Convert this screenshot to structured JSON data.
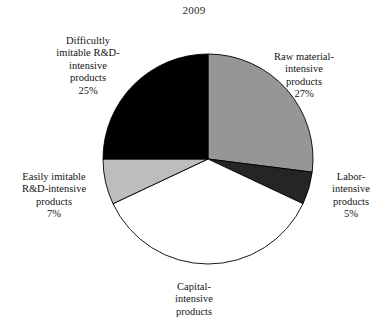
{
  "chart": {
    "title": "2009"
  },
  "labels": {
    "difficultly": {
      "text": "Difficultly\nimitable R&D-\nintensive\nproducts",
      "percent": "25%"
    },
    "raw_material": {
      "text": "Raw material-\nintensive\nproducts",
      "percent": "27%"
    },
    "labor": {
      "text": "Labor-\nintensive\nproducts",
      "percent": "5%"
    },
    "easily": {
      "text": "Easily imitable\nR&D-intensive\nproducts",
      "percent": "7%"
    },
    "capital": {
      "text": "Capital-\nintensive\nproducts",
      "percent": ""
    }
  },
  "chart_data": {
    "type": "pie",
    "title": "2009",
    "xlabel": "",
    "ylabel": "",
    "legend_position": "none",
    "grid": false,
    "start_angle_deg": 0,
    "direction": "clockwise",
    "categories": [
      "Raw material-intensive products",
      "Labor-intensive products",
      "Capital-intensive products",
      "Easily imitable R&D-intensive products",
      "Difficultly imitable R&D-intensive products"
    ],
    "values": [
      27,
      5,
      36,
      7,
      25
    ],
    "value_labels": [
      "27%",
      "5%",
      "",
      "7%",
      "25%"
    ],
    "colors": [
      "#969696",
      "#252525",
      "#ffffff",
      "#bdbdbd",
      "#000000"
    ],
    "slice_edge_color": "#000000",
    "slices": [
      {
        "name": "Raw material-intensive products",
        "value": 27,
        "label": "27%",
        "color": "#969696",
        "start_deg": 0,
        "end_deg": 97.2
      },
      {
        "name": "Labor-intensive products",
        "value": 5,
        "label": "5%",
        "color": "#252525",
        "start_deg": 97.2,
        "end_deg": 115.2
      },
      {
        "name": "Capital-intensive products",
        "value": 36,
        "label": "",
        "color": "#ffffff",
        "start_deg": 115.2,
        "end_deg": 244.8
      },
      {
        "name": "Easily imitable R&D-intensive products",
        "value": 7,
        "label": "7%",
        "color": "#bdbdbd",
        "start_deg": 244.8,
        "end_deg": 270
      },
      {
        "name": "Difficultly imitable R&D-intensive products",
        "value": 25,
        "label": "25%",
        "color": "#000000",
        "start_deg": 270,
        "end_deg": 360
      }
    ]
  },
  "geometry": {
    "cx": 208,
    "cy": 159,
    "r": 105
  }
}
